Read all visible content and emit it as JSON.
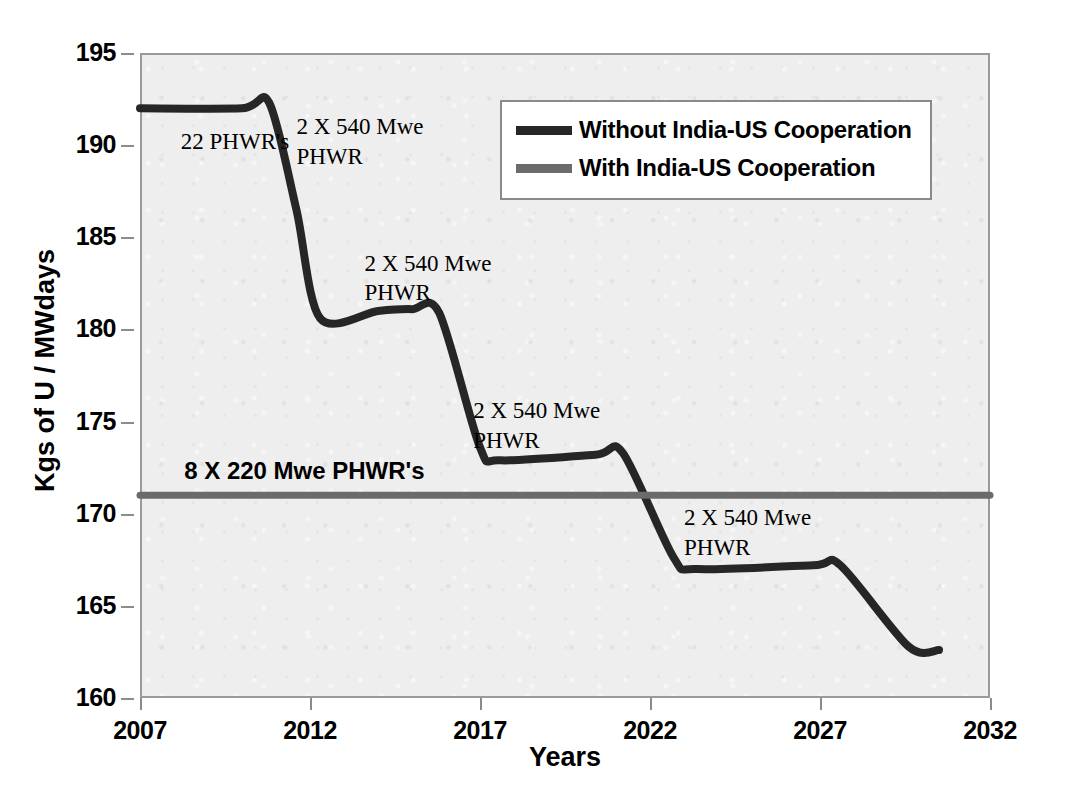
{
  "chart_data": {
    "type": "line",
    "title": "",
    "xlabel": "Years",
    "ylabel": "Kgs of U / MWdays",
    "xlim": [
      2007,
      2032
    ],
    "ylim": [
      160,
      195
    ],
    "xticks": [
      "2007",
      "2012",
      "2017",
      "2022",
      "2027",
      "2032"
    ],
    "xtick_values": [
      2007,
      2012,
      2017,
      2022,
      2027,
      2032
    ],
    "yticks": [
      "160",
      "165",
      "170",
      "175",
      "180",
      "185",
      "190",
      "195"
    ],
    "ytick_values": [
      160,
      165,
      170,
      175,
      180,
      185,
      190,
      195
    ],
    "grid": false,
    "legend_position": "top-right",
    "series": [
      {
        "name": "Without India-US Cooperation",
        "color": "#262626",
        "x": [
          2007.0,
          2010.0,
          2010.8,
          2011.6,
          2012.3,
          2014.0,
          2015.0,
          2015.8,
          2017.0,
          2017.6,
          2020.4,
          2021.2,
          2022.7,
          2023.4,
          2026.8,
          2027.6,
          2029.6,
          2030.5
        ],
        "y": [
          192.0,
          192.0,
          192.3,
          186.5,
          180.6,
          181.0,
          181.1,
          180.9,
          173.6,
          172.9,
          173.2,
          173.3,
          167.6,
          167.0,
          167.2,
          167.2,
          162.8,
          162.6
        ]
      },
      {
        "name": "With India-US Cooperation",
        "color": "#6b6b6b",
        "x": [
          2007.0,
          2032.0
        ],
        "y": [
          171.0,
          171.0
        ]
      }
    ],
    "annotations": [
      {
        "text": "22 PHWR's",
        "x": 2008.2,
        "y": 190.0,
        "style": "serif"
      },
      {
        "text": "2 X 540 Mwe\nPHWR",
        "x": 2011.6,
        "y": 190.8,
        "style": "serif"
      },
      {
        "text": "2 X 540 Mwe\nPHWR",
        "x": 2013.6,
        "y": 183.4,
        "style": "serif"
      },
      {
        "text": "8 X 220 Mwe PHWR's",
        "x": 2008.3,
        "y": 172.1,
        "style": "bold"
      },
      {
        "text": "2 X 540 Mwe\nPHWR",
        "x": 2016.8,
        "y": 175.4,
        "style": "serif"
      },
      {
        "text": "2 X 540 Mwe\nPHWR",
        "x": 2023.0,
        "y": 169.6,
        "style": "serif"
      }
    ]
  },
  "legend": {
    "entries": [
      {
        "label": "Without India-US Cooperation",
        "color": "#262626"
      },
      {
        "label": "With India-US Cooperation",
        "color": "#6b6b6b"
      }
    ]
  },
  "axes": {
    "x_title": "Years",
    "y_title": "Kgs of U / MWdays"
  },
  "annotations_text": {
    "a0": "22 PHWR's",
    "a1": "2 X 540 Mwe\nPHWR",
    "a2": "2 X 540 Mwe\nPHWR",
    "a3": "8 X 220 Mwe PHWR's",
    "a4": "2 X 540 Mwe\nPHWR",
    "a5": "2 X 540 Mwe\nPHWR"
  }
}
